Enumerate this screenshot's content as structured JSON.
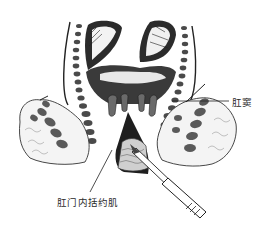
{
  "figure": {
    "type": "anatomical-illustration",
    "palette": {
      "ink": "#1e1e1e",
      "mid": "#6a6a6a",
      "light": "#bdbdbd",
      "paper": "#ffffff"
    }
  },
  "labels": {
    "anal_sinus": "肛窦",
    "internal_anal_sphincter": "肛门内括约肌"
  }
}
